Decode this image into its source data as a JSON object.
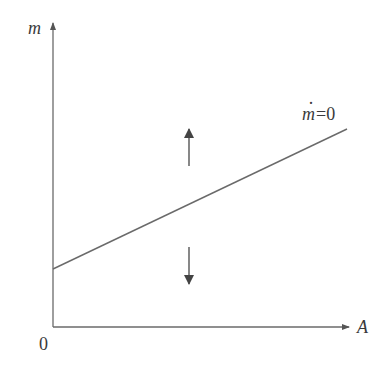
{
  "diagram": {
    "type": "phase-diagram",
    "y_axis": {
      "label": "m"
    },
    "x_axis": {
      "label": "A"
    },
    "origin_label": "0",
    "nullcline": {
      "label_var": "m",
      "label_dot": "·",
      "label_rest": "=0",
      "description": "upward-sloping line starting at positive intercept on m-axis"
    },
    "arrows": [
      {
        "direction": "up",
        "region": "above-line"
      },
      {
        "direction": "down",
        "region": "below-line"
      }
    ],
    "colors": {
      "line": "#6a6a6a",
      "text": "#3a3a3a"
    }
  }
}
